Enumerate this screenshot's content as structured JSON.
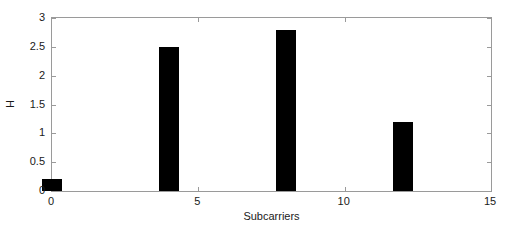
{
  "chart_data": {
    "type": "bar",
    "title": "",
    "subtitle": "",
    "xlabel": "Subcarriers",
    "ylabel": "H",
    "x": [
      0,
      4,
      8,
      12
    ],
    "values": [
      0.2,
      2.5,
      2.8,
      1.2
    ],
    "categories": [
      "0",
      "4",
      "8",
      "12"
    ],
    "bar_width": 0.7,
    "bar_color": "#000000",
    "xlim": [
      0,
      15
    ],
    "ylim": [
      0,
      3
    ],
    "xticks": [
      0,
      5,
      10,
      15
    ],
    "xtick_labels": [
      "0",
      "5",
      "10",
      "15"
    ],
    "yticks": [
      0,
      0.5,
      1,
      1.5,
      2,
      2.5,
      3
    ],
    "ytick_labels": [
      "0",
      "0.5",
      "1",
      "1.5",
      "2",
      "2.5",
      "3"
    ],
    "grid": false,
    "legend": null,
    "legend_position": "none",
    "background_color": "#ffffff",
    "axis_color": "#9a9a9a"
  }
}
